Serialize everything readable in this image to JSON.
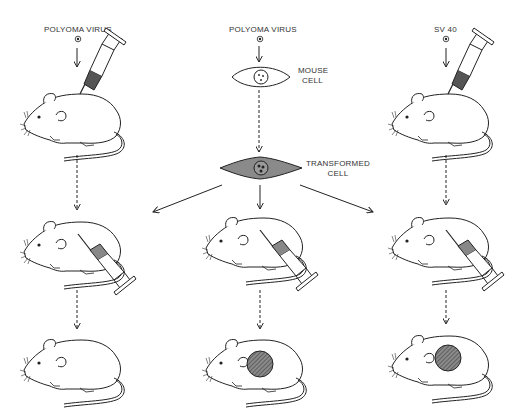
{
  "columns": [
    {
      "id": "left",
      "top_label": "POLYOMA VIRUS",
      "x": 78
    },
    {
      "id": "center",
      "top_label": "POLYOMA VIRUS",
      "x": 260
    },
    {
      "id": "right",
      "top_label": "SV 40",
      "x": 446
    }
  ],
  "labels": {
    "mouse_cell": [
      "MOUSE",
      "CELL"
    ],
    "transformed_cell": [
      "TRANSFORMED",
      "CELL"
    ]
  },
  "stages": {
    "left": [
      "virus-injected mouse",
      "mouse injected with transformed cells",
      "mouse without tumor"
    ],
    "center": [
      "mouse cell infected in culture",
      "transformed cell",
      "mouse injected with transformed cells",
      "mouse with tumor"
    ],
    "right": [
      "virus-injected mouse",
      "mouse injected with transformed cells",
      "mouse with tumor"
    ]
  },
  "colors": {
    "ink": "#222222",
    "cell_fill": "#8a8a8a",
    "tumor_fill": "#6a6a6a",
    "syringe_fill": "#555555"
  }
}
